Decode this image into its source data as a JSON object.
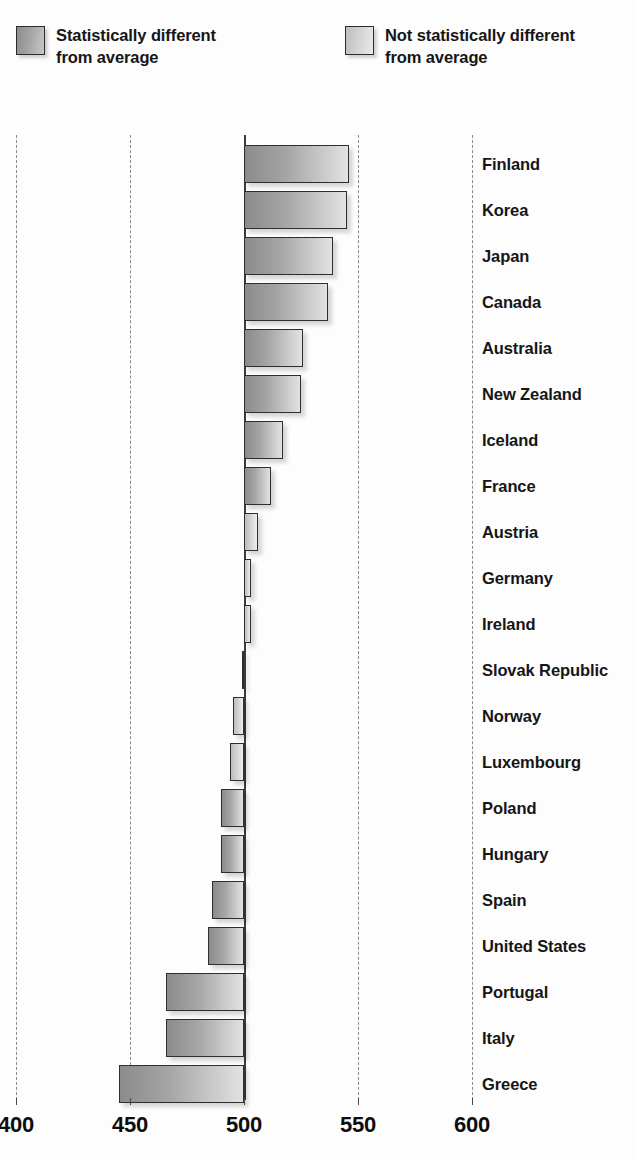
{
  "legend": {
    "items": [
      {
        "label": "Statistically different\nfrom average",
        "swatch": "dark-gray-gradient-swatch",
        "color": "#9a9a9a"
      },
      {
        "label": "Not statistically different\nfrom average",
        "swatch": "light-gray-gradient-swatch",
        "color": "#d0d0d0"
      }
    ]
  },
  "chart_data": {
    "type": "bar",
    "orientation": "horizontal",
    "title": "",
    "xlabel": "",
    "ylabel": "",
    "xlim": [
      400,
      610
    ],
    "baseline": 500,
    "grid": true,
    "gridlines": [
      400,
      450,
      500,
      550,
      600
    ],
    "xticks": [
      "400",
      "450",
      "500",
      "550",
      "600"
    ],
    "legend_position": "top",
    "categories": [
      "Finland",
      "Korea",
      "Japan",
      "Canada",
      "Australia",
      "New Zealand",
      "Iceland",
      "France",
      "Austria",
      "Germany",
      "Ireland",
      "Slovak Republic",
      "Norway",
      "Luxembourg",
      "Poland",
      "Hungary",
      "Spain",
      "United States",
      "Portugal",
      "Italy",
      "Greece"
    ],
    "values": [
      546,
      545,
      539,
      537,
      526,
      525,
      517,
      512,
      506,
      503,
      503,
      499,
      495,
      494,
      490,
      490,
      486,
      484,
      466,
      466,
      445
    ],
    "significance": [
      "different",
      "different",
      "different",
      "different",
      "different",
      "different",
      "different",
      "different",
      "not-different",
      "not-different",
      "not-different",
      "not-different",
      "not-different",
      "not-different",
      "different",
      "different",
      "different",
      "different",
      "different",
      "different",
      "different"
    ]
  }
}
